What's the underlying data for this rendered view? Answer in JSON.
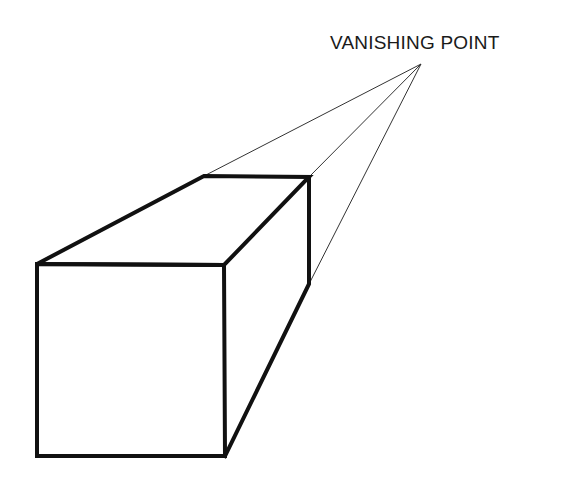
{
  "diagram": {
    "title_label": "VANISHING POINT",
    "colors": {
      "stroke": "#111111",
      "guide": "#333333",
      "background": "#ffffff"
    },
    "vanishing_point": {
      "x": 421,
      "y": 64
    },
    "box": {
      "front_face": {
        "top_left": [
          37,
          264
        ],
        "top_right": [
          224,
          265
        ],
        "bottom_right": [
          225,
          456
        ],
        "bottom_left": [
          37,
          456
        ]
      },
      "back_top_left": [
        204,
        176
      ],
      "back_top_right": [
        309,
        177
      ],
      "back_bottom_right": [
        309,
        284
      ]
    }
  }
}
